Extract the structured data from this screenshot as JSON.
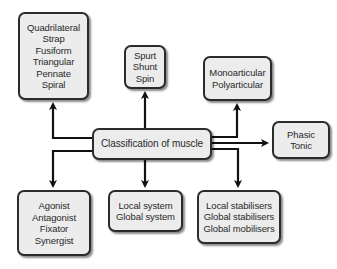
{
  "diagram": {
    "center": {
      "label": "Classification of muscle"
    },
    "nodes": [
      {
        "id": "shape",
        "lines": [
          "Quadrilateral",
          "Strap",
          "Fusiform",
          "Triangular",
          "Pennate",
          "Spiral"
        ]
      },
      {
        "id": "action",
        "lines": [
          "Spurt",
          "Shunt",
          "Spin"
        ]
      },
      {
        "id": "joints",
        "lines": [
          "Monoarticular",
          "Polyarticular"
        ]
      },
      {
        "id": "fibre",
        "lines": [
          "Phasic",
          "Tonic"
        ]
      },
      {
        "id": "role",
        "lines": [
          "Agonist",
          "Antagonist",
          "Fixator",
          "Synergist"
        ]
      },
      {
        "id": "system",
        "lines": [
          "Local system",
          "Global system"
        ]
      },
      {
        "id": "function",
        "lines": [
          "Local stabilisers",
          "Global stabilisers",
          "Global mobilisers"
        ]
      }
    ],
    "colors": {
      "box_fill": "#ececec",
      "border": "#2b2b2b",
      "arrow": "#111111"
    }
  }
}
